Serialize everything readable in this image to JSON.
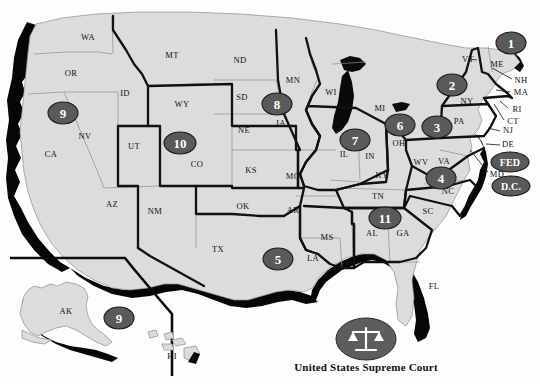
{
  "map": {
    "title": "United States Courts of Appeals Circuits Map",
    "background_color": "#fdfdfd",
    "state_fill_color": "#dcdcdc",
    "state_border_color": "#8d8d8d",
    "circuit_border_color": "#111111",
    "badge_fill_color": "#5a5a5a",
    "badge_text_color": "#ffffff",
    "coast_shadow_color": "#060606",
    "lake_color": "#0a0a0a",
    "state_labels": [
      {
        "abbr": "WA",
        "x": 88,
        "y": 38
      },
      {
        "abbr": "OR",
        "x": 71,
        "y": 74
      },
      {
        "abbr": "ID",
        "x": 125,
        "y": 94
      },
      {
        "abbr": "MT",
        "x": 172,
        "y": 56
      },
      {
        "abbr": "ND",
        "x": 240,
        "y": 61
      },
      {
        "abbr": "SD",
        "x": 242,
        "y": 98
      },
      {
        "abbr": "NE",
        "x": 244,
        "y": 131
      },
      {
        "abbr": "WY",
        "x": 182,
        "y": 105
      },
      {
        "abbr": "NV",
        "x": 85,
        "y": 137
      },
      {
        "abbr": "UT",
        "x": 134,
        "y": 147
      },
      {
        "abbr": "CO",
        "x": 197,
        "y": 165
      },
      {
        "abbr": "CA",
        "x": 51,
        "y": 155
      },
      {
        "abbr": "AZ",
        "x": 112,
        "y": 205
      },
      {
        "abbr": "NM",
        "x": 155,
        "y": 212
      },
      {
        "abbr": "KS",
        "x": 251,
        "y": 171
      },
      {
        "abbr": "OK",
        "x": 243,
        "y": 207
      },
      {
        "abbr": "TX",
        "x": 218,
        "y": 250
      },
      {
        "abbr": "MN",
        "x": 293,
        "y": 81
      },
      {
        "abbr": "IA",
        "x": 281,
        "y": 124
      },
      {
        "abbr": "MO",
        "x": 293,
        "y": 177
      },
      {
        "abbr": "AR",
        "x": 293,
        "y": 211
      },
      {
        "abbr": "LA",
        "x": 313,
        "y": 259
      },
      {
        "abbr": "MS",
        "x": 327,
        "y": 238
      },
      {
        "abbr": "WI",
        "x": 331,
        "y": 93
      },
      {
        "abbr": "MI",
        "x": 380,
        "y": 109
      },
      {
        "abbr": "IL",
        "x": 344,
        "y": 155
      },
      {
        "abbr": "IN",
        "x": 370,
        "y": 157
      },
      {
        "abbr": "OH",
        "x": 399,
        "y": 144
      },
      {
        "abbr": "KY",
        "x": 382,
        "y": 176
      },
      {
        "abbr": "TN",
        "x": 378,
        "y": 197
      },
      {
        "abbr": "AL",
        "x": 372,
        "y": 234
      },
      {
        "abbr": "GA",
        "x": 403,
        "y": 234
      },
      {
        "abbr": "FL",
        "x": 434,
        "y": 287
      },
      {
        "abbr": "SC",
        "x": 428,
        "y": 212
      },
      {
        "abbr": "NC",
        "x": 448,
        "y": 192
      },
      {
        "abbr": "WV",
        "x": 421,
        "y": 163
      },
      {
        "abbr": "VA",
        "x": 444,
        "y": 162
      },
      {
        "abbr": "PA",
        "x": 459,
        "y": 122
      },
      {
        "abbr": "NY",
        "x": 467,
        "y": 102
      },
      {
        "abbr": "VT",
        "x": 468,
        "y": 60
      },
      {
        "abbr": "ME",
        "x": 497,
        "y": 65
      },
      {
        "abbr": "NH",
        "x": 521,
        "y": 81
      },
      {
        "abbr": "MA",
        "x": 521,
        "y": 93
      },
      {
        "abbr": "RI",
        "x": 517,
        "y": 110
      },
      {
        "abbr": "CT",
        "x": 513,
        "y": 122
      },
      {
        "abbr": "NJ",
        "x": 508,
        "y": 131
      },
      {
        "abbr": "DE",
        "x": 508,
        "y": 145
      },
      {
        "abbr": "MD",
        "x": 497,
        "y": 175
      },
      {
        "abbr": "AK",
        "x": 66,
        "y": 312
      },
      {
        "abbr": "HI",
        "x": 172,
        "y": 357
      }
    ],
    "circuit_badges": [
      {
        "label": "1",
        "x": 511,
        "y": 43,
        "rx": 15,
        "ry": 11,
        "wide": false
      },
      {
        "label": "2",
        "x": 452,
        "y": 85,
        "rx": 15,
        "ry": 11,
        "wide": false
      },
      {
        "label": "3",
        "x": 437,
        "y": 127,
        "rx": 15,
        "ry": 11,
        "wide": false
      },
      {
        "label": "4",
        "x": 441,
        "y": 178,
        "rx": 15,
        "ry": 11,
        "wide": false
      },
      {
        "label": "5",
        "x": 278,
        "y": 259,
        "rx": 15,
        "ry": 11,
        "wide": false
      },
      {
        "label": "6",
        "x": 400,
        "y": 125,
        "rx": 15,
        "ry": 11,
        "wide": false
      },
      {
        "label": "7",
        "x": 355,
        "y": 140,
        "rx": 15,
        "ry": 11,
        "wide": false
      },
      {
        "label": "8",
        "x": 277,
        "y": 104,
        "rx": 15,
        "ry": 11,
        "wide": false
      },
      {
        "label": "9",
        "x": 63,
        "y": 113,
        "rx": 15,
        "ry": 11,
        "wide": false
      },
      {
        "label": "10",
        "x": 180,
        "y": 143,
        "rx": 16,
        "ry": 11,
        "wide": false
      },
      {
        "label": "11",
        "x": 385,
        "y": 218,
        "rx": 16,
        "ry": 11,
        "wide": false
      },
      {
        "label": "9",
        "x": 119,
        "y": 318,
        "rx": 15,
        "ry": 11,
        "wide": false
      },
      {
        "label": "FED",
        "x": 510,
        "y": 162,
        "rx": 19,
        "ry": 10,
        "wide": true
      },
      {
        "label": "D.C.",
        "x": 511,
        "y": 186,
        "rx": 19,
        "ry": 10,
        "wide": true
      }
    ],
    "seal": {
      "caption": "United States Supreme Court",
      "icon": "scales-of-justice-icon",
      "cx": 366,
      "cy": 339,
      "rx": 30,
      "ry": 21
    }
  }
}
